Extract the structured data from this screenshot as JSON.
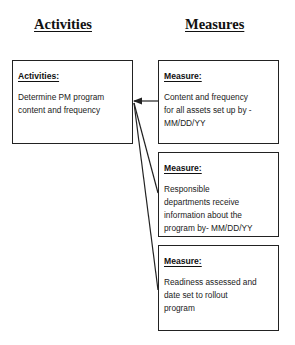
{
  "columns": {
    "activities_title": "Activities",
    "measures_title": "Measures"
  },
  "activity": {
    "heading": "Activities:",
    "text": "Determine PM program\ncontent and  frequency"
  },
  "measures": [
    {
      "heading": "Measure:",
      "text": "Content and frequency\nfor all assets set up by -\nMM/DD/YY"
    },
    {
      "heading": "Measure:",
      "text": "Responsible\ndepartments receive\ninformation about the\nprogram by- MM/DD/YY"
    },
    {
      "heading": "Measure:",
      "text": "Readiness assessed and\ndate set to rollout\nprogram"
    }
  ],
  "colors": {
    "line": "#222222",
    "text": "#111111"
  }
}
